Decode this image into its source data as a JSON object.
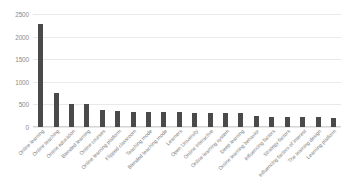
{
  "chart_data": {
    "type": "bar",
    "title": "",
    "subtitle": "",
    "xlabel": "",
    "ylabel": "",
    "ylim": [
      0,
      2500
    ],
    "yticks": [
      0,
      500,
      1000,
      1500,
      2000,
      2500
    ],
    "ytick_labels": [
      "0",
      "500",
      "1000",
      "1500",
      "2000",
      "2500"
    ],
    "grid": true,
    "legend": false,
    "legend_position": "none",
    "bar_color": "#4a4a4a",
    "gridline_color": "#e9e9e9",
    "tick_label_color": "#8a8a8a",
    "category_label_color": "#7d7d7d",
    "category_label_rotation": -45,
    "categories": [
      "Online learning",
      "Online teaching",
      "Online education",
      "Blended learning",
      "Online courses",
      "Online learning platform",
      "Flipped classroom",
      "Teaching mode",
      "Blended teaching mode",
      "Learners",
      "Open University",
      "Online interactive",
      "Online learning system",
      "Deep learning",
      "Online learning behavior",
      "Influencing factors",
      "Strategy factors",
      "Influencing factors of interest",
      "The learning design",
      "Learning platform"
    ],
    "values": [
      2270,
      745,
      520,
      500,
      370,
      360,
      340,
      335,
      330,
      325,
      320,
      315,
      305,
      300,
      245,
      230,
      225,
      220,
      215,
      205
    ]
  }
}
